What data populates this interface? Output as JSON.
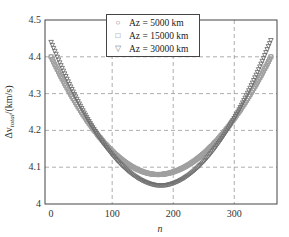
{
  "chart_data": {
    "type": "scatter",
    "title": "",
    "xlabel": "n",
    "ylabel": "Δv_total/(km/s)",
    "xlim": [
      -10,
      370
    ],
    "ylim": [
      4.0,
      4.5
    ],
    "xticks": [
      0,
      100,
      200,
      300
    ],
    "yticks": [
      4,
      4.1,
      4.2,
      4.3,
      4.4,
      4.5
    ],
    "ytick_labels": [
      "4",
      "4.1",
      "4.2",
      "4.3",
      "4.4",
      "4.5"
    ],
    "grid": true,
    "legend_position": "upper center",
    "series": [
      {
        "name": "A_z = 5000 km",
        "marker": "circle",
        "start": 4.4,
        "min": 4.08,
        "min_at": 175,
        "end": 4.4
      },
      {
        "name": "A_z = 15000 km",
        "marker": "square",
        "start": 4.4,
        "min": 4.08,
        "min_at": 175,
        "end": 4.4
      },
      {
        "name": "A_z = 30000 km",
        "marker": "triangle-down",
        "start": 4.44,
        "min": 4.05,
        "min_at": 180,
        "end": 4.445
      }
    ],
    "x": [
      0,
      360
    ]
  },
  "legend": {
    "items": [
      {
        "symbol": "○",
        "label": "Az = 5000 km"
      },
      {
        "symbol": "□",
        "label": "Az = 15000 km"
      },
      {
        "symbol": "▽",
        "label": "Az = 30000 km"
      }
    ]
  },
  "axes": {
    "xlabel": "n",
    "ylabel": "Δv",
    "ylabel_sub": "total",
    "ylabel_unit": "/(km/s)"
  }
}
